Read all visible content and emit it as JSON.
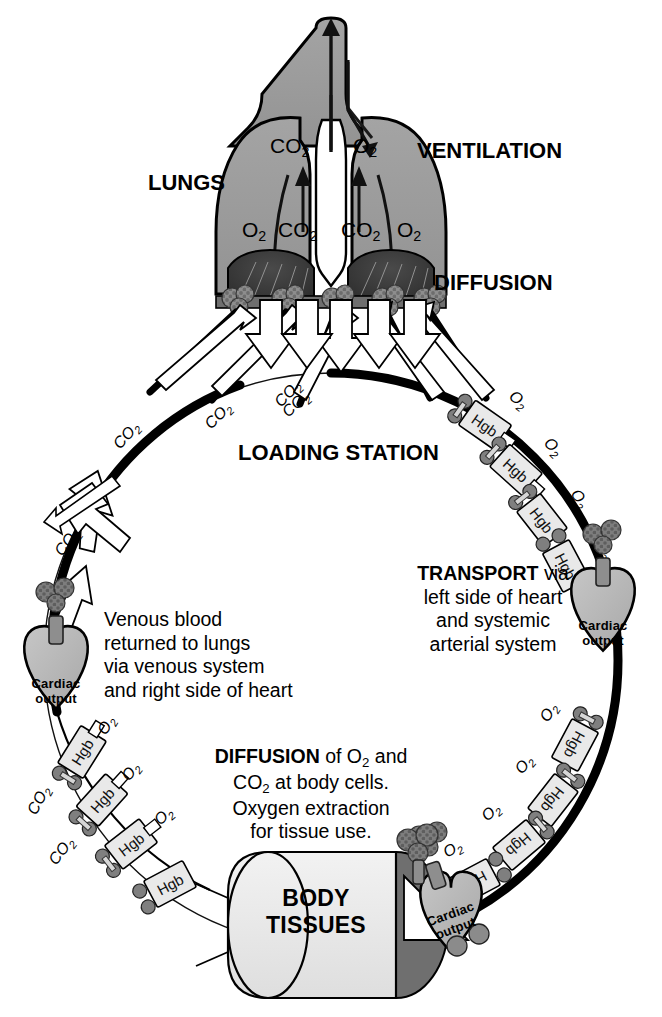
{
  "diagram": {
    "type": "physiology-flow-diagram",
    "headings": {
      "lungs": "LUNGS",
      "ventilation": "VENTILATION",
      "diffusion_top": "DIFFUSION",
      "loading_station": "LOADING STATION",
      "body_tissues_line1": "BODY",
      "body_tissues_line2": "TISSUES"
    },
    "lung_gas_labels": {
      "upper_left": "CO",
      "upper_left_sub": "2",
      "upper_right": "O",
      "upper_right_sub": "2",
      "lower_far_left": "O",
      "lower_far_left_sub": "2",
      "lower_left": "CO",
      "lower_left_sub": "2",
      "lower_right": "CO",
      "lower_right_sub": "2",
      "lower_far_right": "O",
      "lower_far_right_sub": "2"
    },
    "text_blocks": {
      "transport": {
        "bold_lead": "TRANSPORT",
        "line1_rest": " via",
        "line2": "left side of heart",
        "line3": "and systemic",
        "line4": "arterial system"
      },
      "venous": {
        "line1": "Venous blood",
        "line2": "returned to lungs",
        "line3": "via venous system",
        "line4": "and right side of heart"
      },
      "diffusion_body": {
        "bold_lead": "DIFFUSION",
        "line1_rest": " of O",
        "line1_sub": "2",
        "line1_tail": " and",
        "line2_head": "CO",
        "line2_sub": "2",
        "line2_tail": " at body cells.",
        "line3": "Oxygen extraction",
        "line4": "for tissue use."
      }
    },
    "heart_label": {
      "line1": "Cardiac",
      "line2": "output"
    },
    "carrier_label": "Hgb",
    "gas_oxygen": "O",
    "gas_oxygen_sub": "2",
    "gas_carbon_dioxide": "CO",
    "gas_carbon_dioxide_sub": "2",
    "hgb_chain_right": [
      {
        "carrier": "Hgb",
        "gas": "O",
        "sub": "2"
      },
      {
        "carrier": "Hgb",
        "gas": "O",
        "sub": "2"
      },
      {
        "carrier": "Hgb",
        "gas": "O",
        "sub": "2"
      },
      {
        "carrier": "Hgb",
        "gas": "O",
        "sub": "2"
      },
      {
        "carrier": "Hgb",
        "gas": "O",
        "sub": "2"
      },
      {
        "carrier": "Hgb",
        "gas": "O",
        "sub": "2"
      },
      {
        "carrier": "Hgb",
        "gas": "O",
        "sub": "2"
      },
      {
        "carrier": "Hgb",
        "gas": "O",
        "sub": "2"
      }
    ],
    "hgb_chain_left": [
      {
        "carrier": "Hgb",
        "gas": "O",
        "sub": "2"
      },
      {
        "carrier": "Hgb",
        "gas": "O",
        "sub": "2"
      },
      {
        "carrier": "Hgb",
        "gas": "O",
        "sub": "2"
      },
      {
        "carrier": "Hgb",
        "gas": "O",
        "sub": "2"
      }
    ],
    "co2_arrow_labels": [
      "CO2",
      "CO2",
      "CO2",
      "CO2"
    ],
    "co2_side_labels": [
      "CO2",
      "CO2",
      "CO2"
    ],
    "hearts": [
      {
        "position": "left",
        "label_line1": "Cardiac",
        "label_line2": "output"
      },
      {
        "position": "right",
        "label_line1": "Cardiac",
        "label_line2": "output"
      },
      {
        "position": "bottom",
        "label_line1": "Cardiac",
        "label_line2": "output"
      }
    ],
    "colors": {
      "background": "#ffffff",
      "outline": "#000000",
      "lung_fill": "#9b9b9b",
      "lung_dark": "#3a3a3a",
      "hgb_fill": "#e9e9e9",
      "heart_fill": "#b9b9b9",
      "tissue_fill": "#ececec",
      "tissue_shadow": "#7e7e7e",
      "capillary_fill": "#8c8c8c",
      "arrow_fill": "#ffffff"
    }
  }
}
